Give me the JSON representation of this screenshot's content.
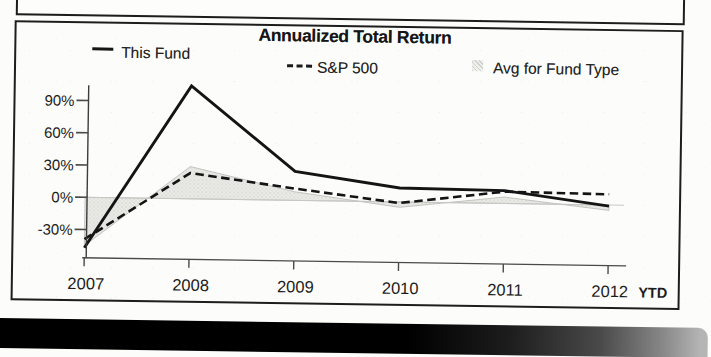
{
  "page": {
    "background": "#fcfcfa",
    "ink_color": "#1c1c1c"
  },
  "chart_data": {
    "type": "line",
    "title": "Annualized Total Return",
    "categories": [
      "2007",
      "2008",
      "2009",
      "2010",
      "2011",
      "2012"
    ],
    "x_suffix": "YTD",
    "y_tick_values": [
      90,
      60,
      30,
      0,
      -30
    ],
    "y_tick_labels": [
      "90%",
      "60%",
      "30%",
      "0%",
      "-30%"
    ],
    "ylim": [
      -55,
      115
    ],
    "y_unit": "%",
    "grid": false,
    "baseline_value": 0,
    "legend_position": "top",
    "series": [
      {
        "name": "This Fund",
        "type": "line",
        "style": "solid",
        "color": "#141414",
        "values": [
          -47,
          105,
          27,
          13,
          12,
          -1
        ]
      },
      {
        "name": "S&P 500",
        "type": "line",
        "style": "dashed",
        "color": "#141414",
        "values": [
          -39,
          24,
          11,
          -1,
          11,
          10
        ]
      },
      {
        "name": "Avg for Fund Type",
        "type": "area",
        "style": "shaded-band-to-zero",
        "color": "#e6e6e3",
        "values": [
          -45,
          30,
          8,
          -5,
          6,
          -5
        ]
      }
    ]
  }
}
